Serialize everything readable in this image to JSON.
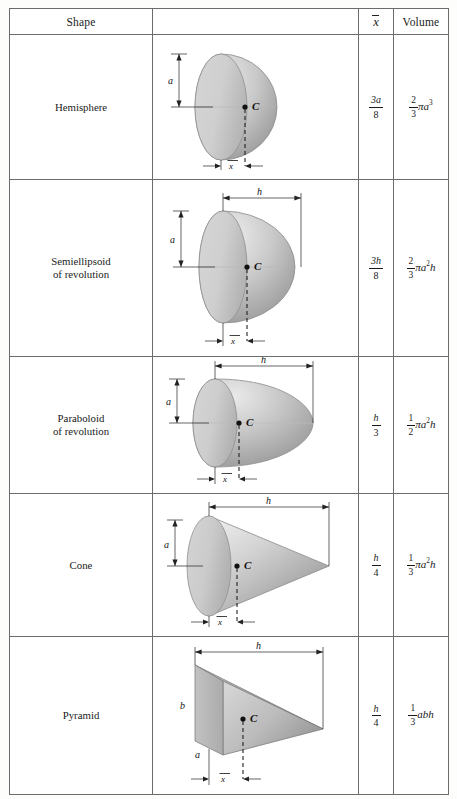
{
  "table": {
    "headers": {
      "shape": "Shape",
      "figure": "",
      "xbar": "x",
      "volume": "Volume"
    },
    "rows": [
      {
        "name": "Hemisphere",
        "name_line1": "Hemisphere",
        "name_line2": "",
        "figure": "hemisphere-diagram",
        "labels": {
          "a": "a",
          "b": "",
          "h": "",
          "xbar": "x",
          "centroid": "C"
        },
        "xbar": {
          "num": "3a",
          "den": "8"
        },
        "volume": {
          "coef_num": "2",
          "coef_den": "3",
          "body": "πa",
          "exp": "3"
        },
        "volume_text": "2/3 πa³",
        "xbar_text": "3a/8"
      },
      {
        "name": "Semiellipsoid of revolution",
        "name_line1": "Semiellipsoid",
        "name_line2": "of revolution",
        "figure": "semiellipsoid-diagram",
        "labels": {
          "a": "a",
          "b": "",
          "h": "h",
          "xbar": "x",
          "centroid": "C"
        },
        "xbar": {
          "num": "3h",
          "den": "8"
        },
        "volume": {
          "coef_num": "2",
          "coef_den": "3",
          "body": "πa",
          "exp": "2",
          "tail": "h"
        },
        "volume_text": "2/3 πa²h",
        "xbar_text": "3h/8"
      },
      {
        "name": "Paraboloid of revolution",
        "name_line1": "Paraboloid",
        "name_line2": "of revolution",
        "figure": "paraboloid-diagram",
        "labels": {
          "a": "a",
          "b": "",
          "h": "h",
          "xbar": "x",
          "centroid": "C"
        },
        "xbar": {
          "num": "h",
          "den": "3"
        },
        "volume": {
          "coef_num": "1",
          "coef_den": "2",
          "body": "πa",
          "exp": "2",
          "tail": "h"
        },
        "volume_text": "1/2 πa²h",
        "xbar_text": "h/3"
      },
      {
        "name": "Cone",
        "name_line1": "Cone",
        "name_line2": "",
        "figure": "cone-diagram",
        "labels": {
          "a": "a",
          "b": "",
          "h": "h",
          "xbar": "x",
          "centroid": "C"
        },
        "xbar": {
          "num": "h",
          "den": "4"
        },
        "volume": {
          "coef_num": "1",
          "coef_den": "3",
          "body": "πa",
          "exp": "2",
          "tail": "h"
        },
        "volume_text": "1/3 πa²h",
        "xbar_text": "h/4"
      },
      {
        "name": "Pyramid",
        "name_line1": "Pyramid",
        "name_line2": "",
        "figure": "pyramid-diagram",
        "labels": {
          "a": "a",
          "b": "b",
          "h": "h",
          "xbar": "x",
          "centroid": "C"
        },
        "xbar": {
          "num": "h",
          "den": "4"
        },
        "volume": {
          "coef_num": "1",
          "coef_den": "3",
          "body": "abh",
          "exp": "",
          "tail": ""
        },
        "volume_text": "1/3 abh",
        "xbar_text": "h/4"
      }
    ]
  },
  "colors": {
    "border": "#6b6b6b",
    "solid_light": "#e2e2e2",
    "solid_mid": "#c4c4c4",
    "solid_dark": "#9b9b9b",
    "ink": "#1a1a1a",
    "page_bg": "#fdfdfb"
  }
}
